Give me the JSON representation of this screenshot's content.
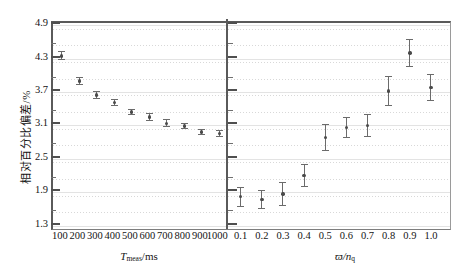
{
  "figure": {
    "ylabel": "相对百分比偏差/%",
    "y_ticks": [
      "4.9",
      "4.3",
      "3.7",
      "3.1",
      "2.5",
      "1.9",
      "1.3"
    ],
    "y_tick_values": [
      4.9,
      4.3,
      3.7,
      3.1,
      2.5,
      1.9,
      1.3
    ],
    "ylim": [
      1.24,
      4.94
    ]
  },
  "panel_left": {
    "xtitle_main": "T",
    "xtitle_sub": "meas",
    "xtitle_unit": "/ms",
    "x_ticks": [
      "100",
      "200",
      "300",
      "400",
      "500",
      "600",
      "700",
      "800",
      "900",
      "1000"
    ]
  },
  "panel_right": {
    "xtitle_main": "ϖ",
    "xtitle_sub": "q",
    "xtitle_unit": "/n",
    "x_ticks": [
      "0.1",
      "0.2",
      "0.3",
      "0.4",
      "0.5",
      "0.6",
      "0.7",
      "0.8",
      "0.9",
      "1.0"
    ]
  },
  "chart_data": [
    {
      "type": "scatter",
      "panel": "left",
      "title": "",
      "xlabel": "T_meas/ms",
      "ylabel": "相对百分比偏差/%",
      "x": [
        100,
        200,
        300,
        400,
        500,
        600,
        700,
        800,
        900,
        1000
      ],
      "xlim": [
        50,
        1050
      ],
      "ylim": [
        1.24,
        4.94
      ],
      "values": [
        4.35,
        3.9,
        3.65,
        3.51,
        3.34,
        3.25,
        3.14,
        3.09,
        2.98,
        2.95
      ],
      "yerr": [
        0.08,
        0.07,
        0.07,
        0.06,
        0.06,
        0.07,
        0.07,
        0.06,
        0.06,
        0.06
      ],
      "grid": true,
      "legend": "none"
    },
    {
      "type": "scatter",
      "panel": "right",
      "title": "",
      "xlabel": "ϖ/n_q",
      "ylabel": "相对百分比偏差/%",
      "x": [
        0.1,
        0.2,
        0.3,
        0.4,
        0.5,
        0.6,
        0.7,
        0.8,
        0.9,
        1.0
      ],
      "xlim": [
        0.04,
        1.09
      ],
      "ylim": [
        1.24,
        4.94
      ],
      "values": [
        1.82,
        1.77,
        1.87,
        2.2,
        2.88,
        3.06,
        3.1,
        3.72,
        4.4,
        3.78
      ],
      "yerr": [
        0.18,
        0.17,
        0.21,
        0.2,
        0.24,
        0.19,
        0.21,
        0.27,
        0.25,
        0.25
      ],
      "grid": true,
      "legend": "none"
    }
  ]
}
